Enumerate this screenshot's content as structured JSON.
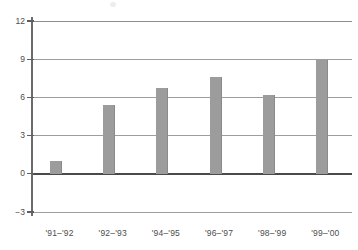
{
  "chart_data": {
    "type": "bar",
    "title": "",
    "xlabel": "",
    "ylabel": "",
    "categories": [
      "'91–'92",
      "'92–'93",
      "'94–'95",
      "'96–'97",
      "'98–'99",
      "'99–'00"
    ],
    "values": [
      1.0,
      5.4,
      6.7,
      7.6,
      6.2,
      8.9
    ],
    "ylim": [
      -3,
      12
    ],
    "yticks": [
      12,
      9,
      6,
      3,
      0,
      -3
    ],
    "ytick_labels": [
      "12",
      "9",
      "6",
      "3",
      "0",
      "−3"
    ],
    "grid": true,
    "legend": false,
    "bar_color": "#9c9c9c",
    "axis_color": "#6b6b6b",
    "gridline_color": "#9d9d9d",
    "zero_line_color": "#4a4a4a",
    "text_color": "#4d4d4d"
  }
}
